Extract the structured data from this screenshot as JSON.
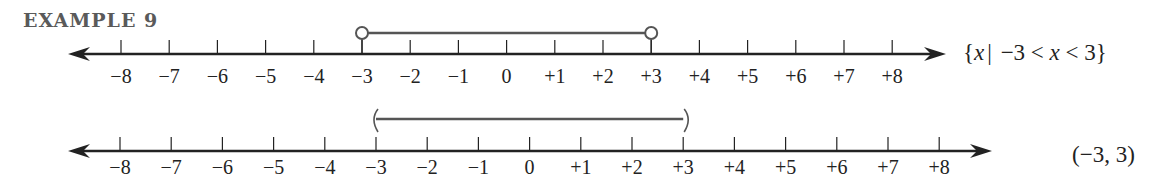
{
  "title": "EXAMPLE 9",
  "colors": {
    "axis": "#222222",
    "interval": "#555555",
    "title": "#5a5a5a"
  },
  "chart_data": [
    {
      "type": "number-line",
      "name": "set-builder",
      "tick_values": [
        -8,
        -7,
        -6,
        -5,
        -4,
        -3,
        -2,
        -1,
        0,
        1,
        2,
        3,
        4,
        5,
        6,
        7,
        8
      ],
      "tick_labels": [
        "−8",
        "−7",
        "−6",
        "−5",
        "−4",
        "−3",
        "−2",
        "−1",
        "0",
        "+1",
        "+2",
        "+3",
        "+4",
        "+5",
        "+6",
        "+7",
        "+8"
      ],
      "interval": {
        "start": -3,
        "end": 3,
        "left_endpoint": "open-circle",
        "right_endpoint": "open-circle"
      },
      "notation": "{x | −3 < x < 3}",
      "arrows": "both"
    },
    {
      "type": "number-line",
      "name": "interval-notation",
      "tick_values": [
        -8,
        -7,
        -6,
        -5,
        -4,
        -3,
        -2,
        -1,
        0,
        1,
        2,
        3,
        4,
        5,
        6,
        7,
        8
      ],
      "tick_labels": [
        "−8",
        "−7",
        "−6",
        "−5",
        "−4",
        "−3",
        "−2",
        "−1",
        "0",
        "+1",
        "+2",
        "+3",
        "+4",
        "+5",
        "+6",
        "+7",
        "+8"
      ],
      "interval": {
        "start": -3,
        "end": 3,
        "left_endpoint": "parenthesis",
        "right_endpoint": "parenthesis"
      },
      "notation": "(−3, 3)",
      "arrows": "both"
    }
  ],
  "notations": {
    "top": {
      "open": "{",
      "var1": "x",
      "bar": "|",
      "mid": " −3 < ",
      "var2": "x",
      "close": " < 3}"
    },
    "bottom": "(−3, 3)"
  }
}
